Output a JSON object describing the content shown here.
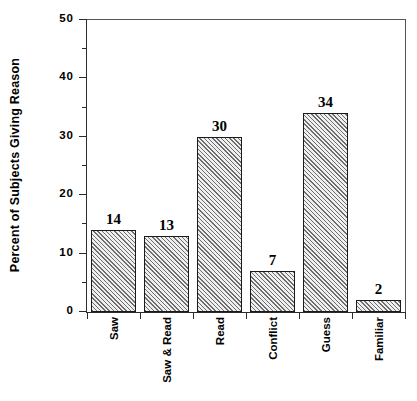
{
  "chart_data": {
    "type": "bar",
    "title": "",
    "xlabel": "",
    "ylabel": "Percent of Subjects Giving Reason",
    "categories": [
      "Saw",
      "Saw & Read",
      "Read",
      "Conflict",
      "Guess",
      "Familiar"
    ],
    "values": [
      14,
      13,
      30,
      7,
      34,
      2
    ],
    "value_labels": [
      "14",
      "13",
      "30",
      "7",
      "34",
      "2"
    ],
    "ylim": [
      0,
      50
    ],
    "y_major_ticks": [
      0,
      10,
      20,
      30,
      40,
      50
    ],
    "y_major_tick_labels": [
      "0",
      "10",
      "20",
      "30",
      "40",
      "50"
    ],
    "y_minor_ticks": [
      5,
      15,
      25,
      35,
      45
    ],
    "grid": false,
    "legend": null,
    "bar_fill": "#efefef",
    "bar_hatch_color": "#6e6e6e",
    "bar_edge_color": "#1a1a1a",
    "axis_color": "#2b2b2b",
    "background": "#ffffff"
  }
}
